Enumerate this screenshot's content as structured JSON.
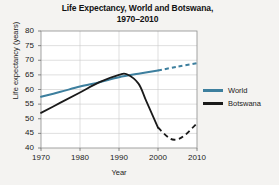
{
  "chart_data": {
    "type": "line",
    "title": "Life Expectancy, World and Botswana, 1970–2010",
    "title_line1": "Life Expectancy, World and Botswana,",
    "title_line2": "1970–2010",
    "xlabel": "Year",
    "ylabel": "Life expectancy (years)",
    "xlim": [
      1970,
      2010
    ],
    "ylim": [
      40,
      80
    ],
    "xticks": [
      1970,
      1980,
      1990,
      2000,
      2010
    ],
    "yticks": [
      40,
      45,
      50,
      55,
      60,
      65,
      70,
      75,
      80
    ],
    "grid": true,
    "legend_position": "right",
    "colors": {
      "world": "#3d7f9e",
      "botswana": "#1a1a1a"
    },
    "series": [
      {
        "name": "World",
        "color": "#3d7f9e",
        "solid_until": 2000,
        "dashed_after": 2000,
        "x": [
          1970,
          1975,
          1980,
          1985,
          1990,
          1995,
          2000,
          2005,
          2010
        ],
        "values": [
          57.5,
          59.2,
          61.0,
          62.5,
          64.2,
          65.4,
          66.5,
          67.8,
          69.0
        ]
      },
      {
        "name": "Botswana",
        "color": "#1a1a1a",
        "solid_until": 2000,
        "dashed_after": 2000,
        "x": [
          1970,
          1975,
          1980,
          1985,
          1990,
          1992,
          1995,
          1997,
          2000,
          2003,
          2005,
          2007,
          2010
        ],
        "values": [
          52.0,
          55.5,
          59.0,
          62.5,
          65.0,
          65.2,
          62.0,
          56.0,
          47.0,
          43.3,
          43.0,
          44.5,
          48.5
        ]
      }
    ]
  },
  "legend": {
    "items": [
      {
        "label": "World",
        "color": "#3d7f9e"
      },
      {
        "label": "Botswana",
        "color": "#1a1a1a"
      }
    ]
  }
}
